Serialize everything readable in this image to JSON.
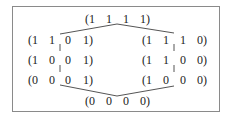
{
  "diagram": {
    "top": {
      "tokens": [
        "(1",
        "1",
        "1",
        "1)"
      ]
    },
    "left": [
      {
        "tokens": [
          "(1",
          "1",
          "0",
          "1)"
        ]
      },
      {
        "tokens": [
          "(1",
          "0",
          "0",
          "1)"
        ]
      },
      {
        "tokens": [
          "(0",
          "0",
          "0",
          "1)"
        ]
      }
    ],
    "right": [
      {
        "tokens": [
          "(1",
          "1",
          "1",
          "0)"
        ]
      },
      {
        "tokens": [
          "(1",
          "1",
          "0",
          "0)"
        ]
      },
      {
        "tokens": [
          "(1",
          "0",
          "0",
          "0)"
        ]
      }
    ],
    "bottom": {
      "tokens": [
        "(0",
        "0",
        "0",
        "0)"
      ]
    }
  }
}
